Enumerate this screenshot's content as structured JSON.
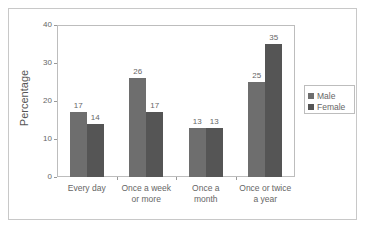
{
  "chart_data": {
    "type": "bar",
    "title": "",
    "xlabel": "",
    "ylabel": "Percentage",
    "ylim": [
      0,
      40
    ],
    "yticks": [
      0,
      10,
      20,
      30,
      40
    ],
    "grid": false,
    "legend_position": "right",
    "categories": [
      "Every day",
      "Once a week or more",
      "Once a month",
      "Once or twice a year"
    ],
    "category_lines": [
      [
        "Every day"
      ],
      [
        "Once a week",
        "or more"
      ],
      [
        "Once a",
        "month"
      ],
      [
        "Once or twice",
        "a year"
      ]
    ],
    "series": [
      {
        "name": "Male",
        "values": [
          17,
          26,
          13,
          25
        ],
        "color": "#6e6e6e"
      },
      {
        "name": "Female",
        "values": [
          14,
          17,
          13,
          35
        ],
        "color": "#555555"
      }
    ]
  },
  "labels": {
    "ylabel": "Percentage",
    "legend_male": "Male",
    "legend_female": "Female"
  }
}
